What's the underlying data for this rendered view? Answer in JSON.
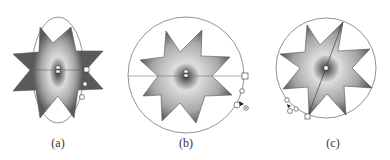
{
  "figure": {
    "panels": [
      {
        "id": "a",
        "label": "(a)",
        "description": "Star with elliptical radial gradient; gradient ellipse handles"
      },
      {
        "id": "b",
        "label": "(b)",
        "description": "Star with circular radial gradient; horizontal radius handle"
      },
      {
        "id": "c",
        "label": "(c)",
        "description": "Star with rotated radial gradient; diagonal axis handle"
      }
    ]
  },
  "colors": {
    "star_edge": "#555555",
    "gradient_center": "#3a3a3a",
    "gradient_mid": "#d8d8d8",
    "gradient_outer": "#9a9a9a",
    "gradient_edge": "#5a5a5a",
    "outline": "#777777"
  }
}
